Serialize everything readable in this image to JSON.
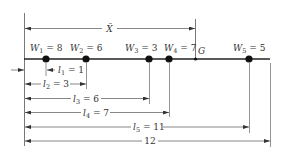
{
  "diagram": {
    "title": "",
    "colors": {
      "line": "#444444",
      "beam": "#222222",
      "dot": "#111111",
      "text": "#333333",
      "background": "#ffffff"
    },
    "centroid": {
      "label": "G",
      "distance_label": "X̄"
    },
    "weights": [
      {
        "symbol": "W",
        "sub": "1",
        "eq": " = 8",
        "value": 8
      },
      {
        "symbol": "W",
        "sub": "2",
        "eq": " = 6",
        "value": 6
      },
      {
        "symbol": "W",
        "sub": "3",
        "eq": " = 3",
        "value": 3
      },
      {
        "symbol": "W",
        "sub": "4",
        "eq": " = 7",
        "value": 7
      },
      {
        "symbol": "W",
        "sub": "5",
        "eq": " = 5",
        "value": 5
      }
    ],
    "distances": [
      {
        "symbol": "l",
        "sub": "1",
        "eq": " = 1",
        "value": 1
      },
      {
        "symbol": "l",
        "sub": "2",
        "eq": " = 3",
        "value": 3
      },
      {
        "symbol": "l",
        "sub": "3",
        "eq": " = 6",
        "value": 6
      },
      {
        "symbol": "l",
        "sub": "4",
        "eq": " = 7",
        "value": 7
      },
      {
        "symbol": "l",
        "sub": "5",
        "eq": " = 11",
        "value": 11
      }
    ],
    "total_length": {
      "label": "12",
      "value": 12
    }
  }
}
